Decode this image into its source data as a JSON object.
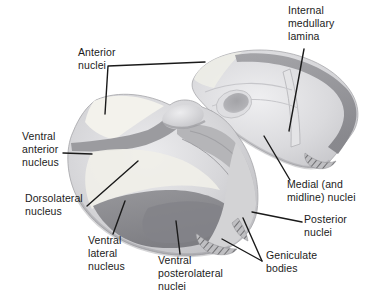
{
  "figure": {
    "palette": {
      "background": "#ffffff",
      "body_light": "#d7d7d9",
      "highlight_cream": "#f2f1ea",
      "band_dark": "#97979b",
      "lateral_dark": "#8a8a8e",
      "posterior_light": "#d3d3d5",
      "leader_line": "#1a1a1a",
      "text": "#1b1b1b"
    },
    "labels": {
      "anterior_nuclei": [
        "Anterior",
        "nuclei"
      ],
      "internal_medullary_lamina": [
        "Internal",
        "medullary",
        "lamina"
      ],
      "ventral_anterior_nucleus": [
        "Ventral",
        "anterior",
        "nucleus"
      ],
      "dorsolateral_nucleus": [
        "Dorsolateral",
        "nucleus"
      ],
      "ventral_lateral_nucleus": [
        "Ventral",
        "lateral",
        "nucleus"
      ],
      "ventral_posterolateral_nuclei": [
        "Ventral",
        "posterolateral",
        "nuclei"
      ],
      "medial_midline_nuclei": [
        "Medial (and",
        "midline) nuclei"
      ],
      "posterior_nuclei": [
        "Posterior",
        "nuclei"
      ],
      "geniculate_bodies": [
        "Geniculate",
        "bodies"
      ]
    }
  }
}
